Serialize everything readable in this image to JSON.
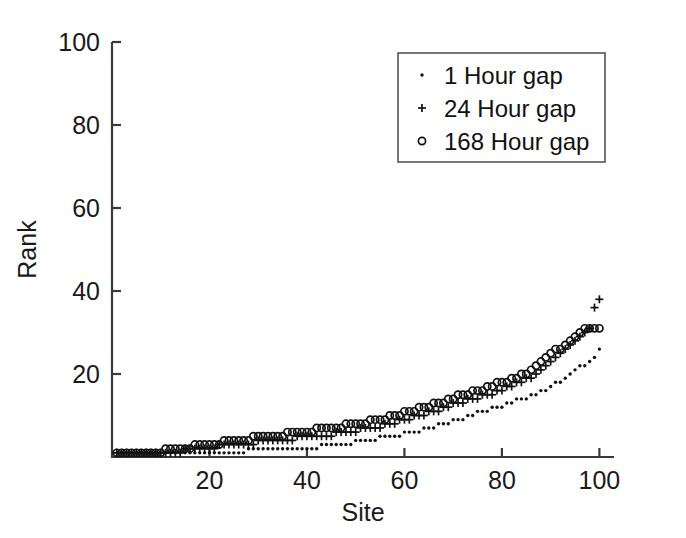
{
  "chart_data": {
    "type": "scatter",
    "title": "",
    "xlabel": "Site",
    "ylabel": "Rank",
    "xlim": [
      0,
      103
    ],
    "ylim": [
      0,
      100
    ],
    "xticks": [
      20,
      40,
      60,
      80,
      100
    ],
    "yticks": [
      0,
      20,
      40,
      60,
      80,
      100
    ],
    "xtick_labels": [
      "20",
      "40",
      "60",
      "80",
      "100"
    ],
    "ytick_labels": [
      "20",
      "40",
      "60",
      "80",
      "100"
    ],
    "grid": false,
    "legend_position": "upper right",
    "series": [
      {
        "name": "1 Hour gap",
        "marker": "dot",
        "x": [
          1,
          2,
          3,
          4,
          5,
          6,
          7,
          8,
          9,
          10,
          11,
          12,
          13,
          14,
          15,
          16,
          17,
          18,
          19,
          20,
          21,
          22,
          23,
          24,
          25,
          26,
          27,
          28,
          29,
          30,
          31,
          32,
          33,
          34,
          35,
          36,
          37,
          38,
          39,
          40,
          41,
          42,
          43,
          44,
          45,
          46,
          47,
          48,
          49,
          50,
          51,
          52,
          53,
          54,
          55,
          56,
          57,
          58,
          59,
          60,
          61,
          62,
          63,
          64,
          65,
          66,
          67,
          68,
          69,
          70,
          71,
          72,
          73,
          74,
          75,
          76,
          77,
          78,
          79,
          80,
          81,
          82,
          83,
          84,
          85,
          86,
          87,
          88,
          89,
          90,
          91,
          92,
          93,
          94,
          95,
          96,
          97,
          98,
          99,
          100
        ],
        "y": [
          1,
          1,
          1,
          1,
          1,
          1,
          1,
          1,
          1,
          1,
          1,
          1,
          1,
          1,
          1,
          1,
          1,
          1,
          1,
          1,
          1,
          1,
          1,
          1,
          1,
          1,
          1,
          2,
          2,
          2,
          2,
          2,
          2,
          2,
          2,
          2,
          2,
          2,
          2,
          2,
          2,
          2,
          3,
          3,
          3,
          3,
          3,
          3,
          3,
          4,
          4,
          4,
          4,
          4,
          5,
          5,
          5,
          5,
          5,
          6,
          6,
          6,
          6,
          7,
          7,
          7,
          8,
          8,
          8,
          9,
          9,
          9,
          10,
          10,
          11,
          11,
          11,
          12,
          12,
          12,
          13,
          13,
          14,
          14,
          14,
          15,
          15,
          16,
          16,
          17,
          18,
          18,
          19,
          20,
          21,
          22,
          22,
          23,
          24,
          26
        ]
      },
      {
        "name": "24 Hour gap",
        "marker": "plus",
        "x": [
          1,
          2,
          3,
          4,
          5,
          6,
          7,
          8,
          9,
          10,
          11,
          12,
          13,
          14,
          15,
          16,
          17,
          18,
          19,
          20,
          21,
          22,
          23,
          24,
          25,
          26,
          27,
          28,
          29,
          30,
          31,
          32,
          33,
          34,
          35,
          36,
          37,
          38,
          39,
          40,
          41,
          42,
          43,
          44,
          45,
          46,
          47,
          48,
          49,
          50,
          51,
          52,
          53,
          54,
          55,
          56,
          57,
          58,
          59,
          60,
          61,
          62,
          63,
          64,
          65,
          66,
          67,
          68,
          69,
          70,
          71,
          72,
          73,
          74,
          75,
          76,
          77,
          78,
          79,
          80,
          81,
          82,
          83,
          84,
          85,
          86,
          87,
          88,
          89,
          90,
          91,
          92,
          93,
          94,
          95,
          96,
          97,
          98,
          99,
          100
        ],
        "y": [
          1,
          1,
          1,
          1,
          1,
          1,
          1,
          1,
          1,
          1,
          1,
          1,
          1,
          1,
          2,
          2,
          2,
          2,
          2,
          2,
          2,
          3,
          3,
          3,
          3,
          3,
          3,
          3,
          3,
          4,
          4,
          4,
          4,
          4,
          4,
          4,
          4,
          5,
          5,
          5,
          5,
          5,
          5,
          5,
          5,
          6,
          6,
          6,
          6,
          6,
          7,
          7,
          7,
          7,
          7,
          8,
          8,
          8,
          9,
          9,
          9,
          10,
          10,
          10,
          11,
          11,
          11,
          12,
          12,
          13,
          13,
          13,
          14,
          14,
          14,
          15,
          15,
          15,
          16,
          16,
          17,
          17,
          18,
          18,
          19,
          19,
          20,
          21,
          22,
          23,
          24,
          25,
          26,
          27,
          28,
          29,
          30,
          31,
          36,
          38
        ]
      },
      {
        "name": "168 Hour gap",
        "marker": "circle",
        "x": [
          1,
          2,
          3,
          4,
          5,
          6,
          7,
          8,
          9,
          10,
          11,
          12,
          13,
          14,
          15,
          16,
          17,
          18,
          19,
          20,
          21,
          22,
          23,
          24,
          25,
          26,
          27,
          28,
          29,
          30,
          31,
          32,
          33,
          34,
          35,
          36,
          37,
          38,
          39,
          40,
          41,
          42,
          43,
          44,
          45,
          46,
          47,
          48,
          49,
          50,
          51,
          52,
          53,
          54,
          55,
          56,
          57,
          58,
          59,
          60,
          61,
          62,
          63,
          64,
          65,
          66,
          67,
          68,
          69,
          70,
          71,
          72,
          73,
          74,
          75,
          76,
          77,
          78,
          79,
          80,
          81,
          82,
          83,
          84,
          85,
          86,
          87,
          88,
          89,
          90,
          91,
          92,
          93,
          94,
          95,
          96,
          97,
          98,
          99,
          100
        ],
        "y": [
          1,
          1,
          1,
          1,
          1,
          1,
          1,
          1,
          1,
          1,
          2,
          2,
          2,
          2,
          2,
          2,
          3,
          3,
          3,
          3,
          3,
          3,
          4,
          4,
          4,
          4,
          4,
          4,
          5,
          5,
          5,
          5,
          5,
          5,
          5,
          6,
          6,
          6,
          6,
          6,
          6,
          7,
          7,
          7,
          7,
          7,
          7,
          8,
          8,
          8,
          8,
          8,
          9,
          9,
          9,
          9,
          10,
          10,
          10,
          11,
          11,
          11,
          12,
          12,
          12,
          13,
          13,
          13,
          14,
          14,
          15,
          15,
          15,
          16,
          16,
          16,
          17,
          17,
          18,
          18,
          18,
          19,
          19,
          20,
          20,
          21,
          22,
          23,
          24,
          25,
          26,
          26,
          27,
          28,
          29,
          30,
          31,
          31,
          31,
          31
        ]
      }
    ]
  },
  "legend": {
    "entries": [
      {
        "label": "1 Hour gap",
        "marker": "dot"
      },
      {
        "label": "24 Hour gap",
        "marker": "plus"
      },
      {
        "label": "168 Hour gap",
        "marker": "circle"
      }
    ]
  },
  "colors": {
    "marker": "#111111",
    "axis": "#3a3a3a",
    "background": "#ffffff"
  }
}
